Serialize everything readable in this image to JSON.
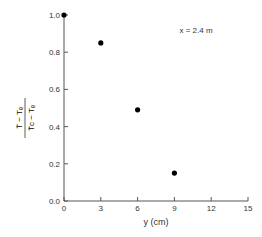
{
  "chart_data": {
    "type": "scatter",
    "title": "",
    "annotation": "x = 2.4 m",
    "xlabel": "y (cm)",
    "ylabel": "(T̄ − Tₑ)/(T̄c − Tₑ)",
    "ylabel_num": "T̄ − Tₑ",
    "ylabel_den": "T̄c − Tₑ",
    "xlim": [
      0,
      15
    ],
    "ylim": [
      0.0,
      1.0
    ],
    "xticks": [
      "0",
      "3",
      "6",
      "9",
      "12",
      "15"
    ],
    "yticks": [
      "0.0",
      "0.2",
      "0.4",
      "0.6",
      "0.8",
      "1.0"
    ],
    "grid": false,
    "series": [
      {
        "name": "x = 2.4 m",
        "x": [
          0,
          3,
          6,
          9
        ],
        "y": [
          1.0,
          0.85,
          0.49,
          0.15
        ]
      }
    ]
  }
}
